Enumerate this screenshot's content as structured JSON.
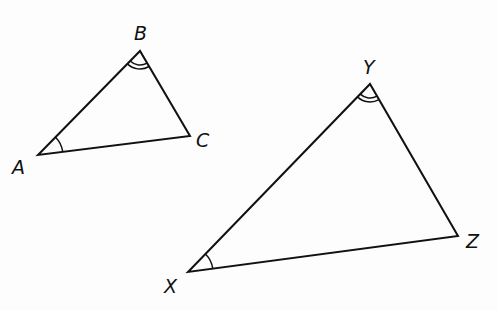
{
  "figure": {
    "triangles": [
      {
        "name": "ABC",
        "vertices": {
          "A": {
            "label": "A",
            "x": 38,
            "y": 155,
            "label_x": 12,
            "label_y": 174
          },
          "B": {
            "label": "B",
            "x": 140,
            "y": 51,
            "label_x": 134,
            "label_y": 40
          },
          "C": {
            "label": "C",
            "x": 190,
            "y": 136,
            "label_x": 196,
            "label_y": 147
          }
        },
        "angle_marks": [
          {
            "vertex": "A",
            "arcs": 1
          },
          {
            "vertex": "B",
            "arcs": 2
          }
        ]
      },
      {
        "name": "XYZ",
        "vertices": {
          "X": {
            "label": "X",
            "x": 188,
            "y": 272,
            "label_x": 164,
            "label_y": 293
          },
          "Y": {
            "label": "Y",
            "x": 370,
            "y": 84,
            "label_x": 363,
            "label_y": 74
          },
          "Z": {
            "label": "Z",
            "x": 458,
            "y": 236,
            "label_x": 466,
            "label_y": 248
          }
        },
        "angle_marks": [
          {
            "vertex": "X",
            "arcs": 1
          },
          {
            "vertex": "Y",
            "arcs": 2
          }
        ]
      }
    ],
    "colors": {
      "stroke": "#111111",
      "background": "#fdfdfd"
    }
  }
}
